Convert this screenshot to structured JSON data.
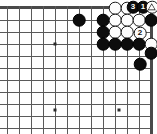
{
  "figure": {
    "kind": "go-board-diagram",
    "title": "",
    "width_px": 157,
    "height_px": 134,
    "board_region": "top-right corner",
    "colors": {
      "background": "#ffffff",
      "grid": "#5a5a5a",
      "edge": "#4a4a4a",
      "black_stone": "#0d0d0d",
      "white_stone": "#fcfcfc",
      "star_point": "#2a2a2a"
    }
  },
  "grid": {
    "origin_x": 7,
    "origin_y": 7,
    "spacing": 12,
    "columns": 13,
    "rows": 11,
    "vertical_line_xs": [
      7,
      19,
      31,
      43,
      55,
      67,
      79,
      91,
      103,
      115,
      127,
      139,
      151
    ],
    "horizontal_line_ys": [
      7,
      20,
      32,
      44,
      56,
      68,
      80,
      92,
      104,
      116,
      128
    ],
    "top_edge_y": 7,
    "right_edge_x": 151
  },
  "star_points": [
    {
      "name": "star-point-left-upper",
      "x": 55,
      "y": 44
    },
    {
      "name": "star-point-left-lower",
      "x": 55,
      "y": 110
    },
    {
      "name": "star-point-right-lower",
      "x": 119,
      "y": 110
    }
  ],
  "stones": [
    {
      "id": "b-lone",
      "color": "black",
      "x": 79,
      "y": 20,
      "label": "",
      "marker": ""
    },
    {
      "id": "w-top-1",
      "color": "white",
      "x": 115,
      "y": 8,
      "label": "",
      "marker": ""
    },
    {
      "id": "w-top-2",
      "color": "white",
      "x": 127,
      "y": 8,
      "label": "",
      "marker": ""
    },
    {
      "id": "b-move-3",
      "color": "black",
      "x": 133,
      "y": 7,
      "label": "3",
      "marker": ""
    },
    {
      "id": "b-move-1",
      "color": "black",
      "x": 143,
      "y": 7,
      "label": "1",
      "marker": ""
    },
    {
      "id": "w-triangle",
      "color": "white",
      "x": 152,
      "y": 7,
      "label": "",
      "marker": "triangle"
    },
    {
      "id": "b-r2-c1",
      "color": "black",
      "x": 103,
      "y": 20,
      "label": "",
      "marker": ""
    },
    {
      "id": "w-r2-c2",
      "color": "white",
      "x": 115,
      "y": 20,
      "label": "",
      "marker": ""
    },
    {
      "id": "w-r2-c3",
      "color": "white",
      "x": 127,
      "y": 20,
      "label": "",
      "marker": ""
    },
    {
      "id": "w-r2-c4",
      "color": "white",
      "x": 139,
      "y": 20,
      "label": "",
      "marker": ""
    },
    {
      "id": "b-r2-c5",
      "color": "black",
      "x": 151,
      "y": 20,
      "label": "",
      "marker": ""
    },
    {
      "id": "b-r3-c1",
      "color": "black",
      "x": 103,
      "y": 32,
      "label": "",
      "marker": ""
    },
    {
      "id": "w-r3-c2",
      "color": "white",
      "x": 115,
      "y": 32,
      "label": "",
      "marker": ""
    },
    {
      "id": "w-r3-c3",
      "color": "white",
      "x": 127,
      "y": 32,
      "label": "",
      "marker": ""
    },
    {
      "id": "w-move-2",
      "color": "white",
      "x": 140,
      "y": 33,
      "label": "2",
      "marker": ""
    },
    {
      "id": "b-r4-c1",
      "color": "black",
      "x": 103,
      "y": 44,
      "label": "",
      "marker": ""
    },
    {
      "id": "b-r4-c2",
      "color": "black",
      "x": 115,
      "y": 44,
      "label": "",
      "marker": ""
    },
    {
      "id": "b-r4-c3",
      "color": "black",
      "x": 127,
      "y": 44,
      "label": "",
      "marker": ""
    },
    {
      "id": "b-r4-c4",
      "color": "black",
      "x": 139,
      "y": 44,
      "label": "",
      "marker": ""
    },
    {
      "id": "w-r4-c5",
      "color": "white",
      "x": 151,
      "y": 44,
      "label": "",
      "marker": ""
    },
    {
      "id": "b-r5-c5",
      "color": "black",
      "x": 151,
      "y": 53,
      "label": "",
      "marker": ""
    },
    {
      "id": "b-r6-c4",
      "color": "black",
      "x": 140,
      "y": 64,
      "label": "",
      "marker": ""
    }
  ],
  "stone_radius": 6.3
}
